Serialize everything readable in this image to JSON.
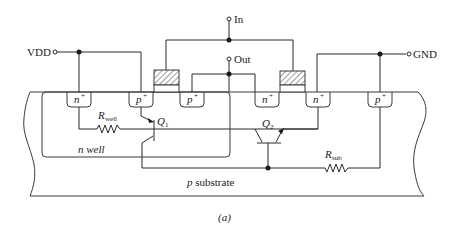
{
  "figure": {
    "caption": "(a)"
  },
  "terminals": {
    "vdd": "VDD",
    "in": "In",
    "out": "Out",
    "gnd": "GND"
  },
  "diffusions": [
    {
      "id": "n1",
      "type": "n",
      "label": "n",
      "sup": "+"
    },
    {
      "id": "p1",
      "type": "p",
      "label": "p",
      "sup": "+"
    },
    {
      "id": "p2",
      "type": "p",
      "label": "p",
      "sup": "+"
    },
    {
      "id": "n2",
      "type": "n",
      "label": "n",
      "sup": "+"
    },
    {
      "id": "n3",
      "type": "n",
      "label": "n",
      "sup": "+"
    },
    {
      "id": "p3",
      "type": "p",
      "label": "p",
      "sup": "+"
    }
  ],
  "regions": {
    "nwell": "n well",
    "substrate_prefix": "p",
    "substrate_suffix": " substrate"
  },
  "transistors": {
    "q1": {
      "label": "Q",
      "sub": "1"
    },
    "q2": {
      "label": "Q",
      "sub": "2"
    }
  },
  "resistors": {
    "rwell": {
      "label": "R",
      "sub": "well"
    },
    "rsub": {
      "label": "R",
      "sub": "sub"
    }
  },
  "colors": {
    "line": "#2a2a2a",
    "gate_hatch": "#3a3a3a",
    "background": "#ffffff"
  }
}
